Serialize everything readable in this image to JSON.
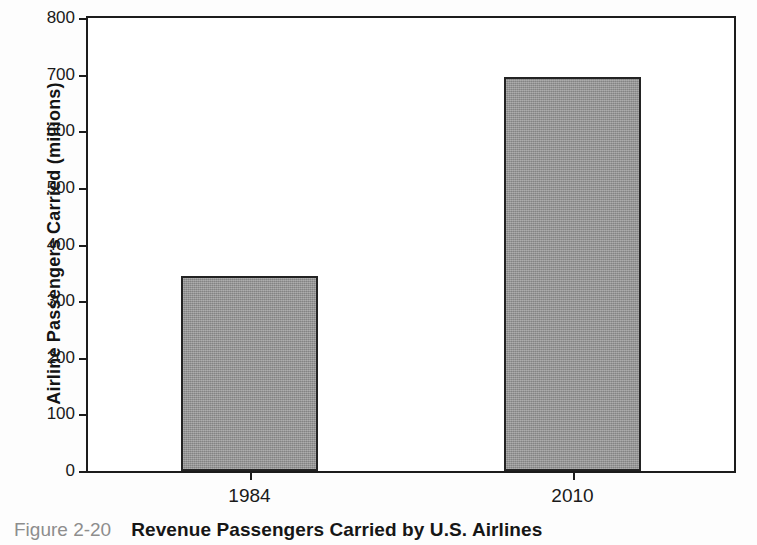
{
  "figure": {
    "caption_label": "Figure 2-20",
    "caption_text": "Revenue Passengers Carried by U.S. Airlines"
  },
  "chart_data": {
    "type": "bar",
    "title": "",
    "categories": [
      "1984",
      "2010"
    ],
    "values": [
      344,
      695
    ],
    "xlabel": "",
    "ylabel": "Airline Passengers Carried (millions)",
    "ylim": [
      0,
      800
    ],
    "yticks": [
      0,
      100,
      200,
      300,
      400,
      500,
      600,
      700,
      800
    ],
    "ytick_labels": [
      "0",
      "100",
      "200",
      "300",
      "400",
      "500",
      "600",
      "700",
      "800"
    ],
    "grid": false,
    "legend": false,
    "bar_color": "#929292",
    "bar_edge_color": "#232323",
    "axis_color": "#1c1c1c",
    "plot_background": "#ffffff"
  }
}
